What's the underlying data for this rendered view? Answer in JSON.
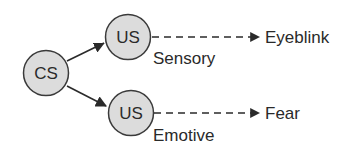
{
  "diagram": {
    "colors": {
      "node_fill": "#dcdcdc",
      "node_stroke": "#3a3a3a",
      "edge": "#2a2a2a",
      "text": "#2a2a2a",
      "background": "#ffffff"
    },
    "nodes": [
      {
        "id": "cs",
        "label": "CS"
      },
      {
        "id": "us_sensory",
        "label": "US",
        "sublabel": "Sensory"
      },
      {
        "id": "us_emotive",
        "label": "US",
        "sublabel": "Emotive"
      }
    ],
    "outputs": [
      {
        "id": "eyeblink",
        "label": "Eyeblink"
      },
      {
        "id": "fear",
        "label": "Fear"
      }
    ],
    "edges": [
      {
        "from": "cs",
        "to": "us_sensory",
        "style": "solid"
      },
      {
        "from": "cs",
        "to": "us_emotive",
        "style": "solid"
      },
      {
        "from": "us_sensory",
        "to": "eyeblink",
        "style": "dashed"
      },
      {
        "from": "us_emotive",
        "to": "fear",
        "style": "dashed"
      }
    ]
  }
}
